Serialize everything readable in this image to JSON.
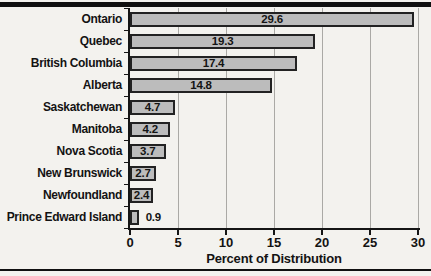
{
  "page": {
    "background": "#f3f2ee",
    "rule_color": "#101010"
  },
  "chart_data": {
    "type": "bar",
    "orientation": "horizontal",
    "title": "",
    "categories": [
      "Ontario",
      "Quebec",
      "British Columbia",
      "Alberta",
      "Saskatchewan",
      "Manitoba",
      "Nova Scotia",
      "New Brunswick",
      "Newfoundland",
      "Prince Edward Island"
    ],
    "values": [
      29.6,
      19.3,
      17.4,
      14.8,
      4.7,
      4.2,
      3.7,
      2.7,
      2.4,
      0.9
    ],
    "value_labels": [
      "29.6",
      "19.3",
      "17.4",
      "14.8",
      "4.7",
      "4.2",
      "3.7",
      "2.7",
      "2.4",
      "0.9"
    ],
    "xlabel": "Percent of Distribution",
    "xlim": [
      0,
      30
    ],
    "xticks": [
      0,
      5,
      10,
      15,
      20,
      25,
      30
    ],
    "grid": true,
    "legend_position": "none",
    "bar_fill": "#bcbcbc",
    "bar_border": "#222222",
    "gridline_color": "#aaa9a5"
  }
}
